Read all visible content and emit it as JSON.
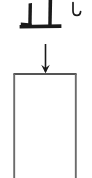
{
  "canvas": {
    "width": 92,
    "height": 178,
    "background": "#ffffff"
  },
  "diagram": {
    "title": "Character stroke into box",
    "ink_color": "#1a1a1a",
    "outline_color": "#6b6b6b",
    "elements": {
      "glyph": {
        "name": "cjk-character-zhi",
        "text": "止",
        "description": "brush-stroke character, clipped at top edge",
        "strokes": {
          "left_vertical": {
            "x": 30,
            "y1": 3,
            "y2": 26,
            "width": 4
          },
          "right_vertical": {
            "x": 50,
            "y1": 0,
            "y2": 26,
            "width": 4
          },
          "baseline_horizontal": {
            "x1": 21,
            "x2": 61,
            "y": 26,
            "height": 3
          },
          "left_foot": {
            "x1": 21,
            "x2": 31,
            "y": 24,
            "height": 2
          }
        }
      },
      "hook_mark": {
        "name": "hook-stroke-mark",
        "text": "し",
        "x": 72,
        "y": 2,
        "width": 9,
        "height": 14
      },
      "arrow": {
        "name": "down-arrow",
        "direction": "down",
        "shaft_x": 45,
        "y_start": 44,
        "y_end": 73,
        "head_width": 9,
        "head_height": 8
      },
      "box": {
        "name": "open-top-box",
        "x": 13,
        "y": 73,
        "width": 64,
        "height": 105,
        "stroke_width": 2,
        "open_side": "bottom",
        "fill": "#ffffff"
      }
    }
  }
}
